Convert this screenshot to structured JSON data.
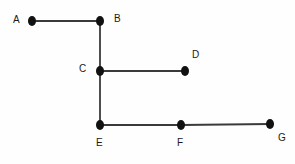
{
  "diagram": {
    "type": "node-link-graph",
    "title": "",
    "background_color": "#fefefe",
    "node_color": "#111111",
    "edge_color": "#3a3a3a",
    "label_color": "#1a1a1a",
    "node_radius_x": 4.0,
    "node_radius_y": 5.0,
    "edge_width": 1.8,
    "nodes": [
      {
        "id": "A",
        "label": "A",
        "x": 32,
        "y": 21,
        "label_x": 13,
        "label_y": 15
      },
      {
        "id": "B",
        "label": "B",
        "x": 100,
        "y": 21,
        "label_x": 114,
        "label_y": 14
      },
      {
        "id": "C",
        "label": "C",
        "x": 100,
        "y": 71,
        "label_x": 79,
        "label_y": 64
      },
      {
        "id": "D",
        "label": "D",
        "x": 185,
        "y": 71,
        "label_x": 192,
        "label_y": 50
      },
      {
        "id": "E",
        "label": "E",
        "x": 100,
        "y": 125,
        "label_x": 96,
        "label_y": 138
      },
      {
        "id": "F",
        "label": "F",
        "x": 181,
        "y": 125,
        "label_x": 177,
        "label_y": 138
      },
      {
        "id": "G",
        "label": "G",
        "x": 270,
        "y": 124,
        "label_x": 278,
        "label_y": 133
      }
    ],
    "edges": [
      {
        "id": "A-B",
        "from": "A",
        "to": "B",
        "x1": 32,
        "y1": 21,
        "x2": 100,
        "y2": 21
      },
      {
        "id": "B-C",
        "from": "B",
        "to": "C",
        "x1": 100,
        "y1": 21,
        "x2": 100,
        "y2": 71
      },
      {
        "id": "C-D",
        "from": "C",
        "to": "D",
        "x1": 100,
        "y1": 71,
        "x2": 185,
        "y2": 71
      },
      {
        "id": "C-E",
        "from": "C",
        "to": "E",
        "x1": 100,
        "y1": 71,
        "x2": 100,
        "y2": 125
      },
      {
        "id": "E-F",
        "from": "E",
        "to": "F",
        "x1": 100,
        "y1": 125,
        "x2": 181,
        "y2": 125
      },
      {
        "id": "F-G",
        "from": "F",
        "to": "G",
        "x1": 181,
        "y1": 125,
        "x2": 270,
        "y2": 124
      }
    ]
  }
}
